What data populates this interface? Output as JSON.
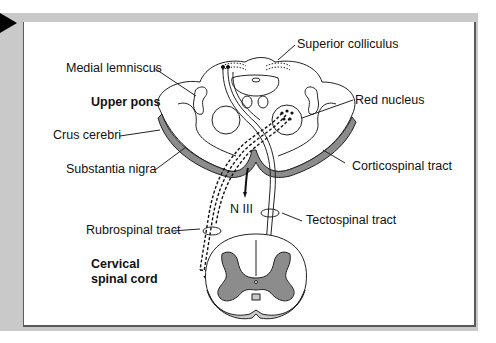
{
  "figure": {
    "marker_icon": "play-triangle-icon",
    "colors": {
      "frame": "#c9c9c9",
      "panel": "#ffffff",
      "border": "#5a5a5a",
      "gray_matter": "#8c8c8c",
      "ink": "#111111"
    },
    "section_labels": {
      "upper": "Upper pons",
      "lower_line1": "Cervical",
      "lower_line2": "spinal cord"
    },
    "labels": {
      "superior_colliculus": "Superior colliculus",
      "medial_lemniscus": "Medial lemniscus",
      "red_nucleus": "Red nucleus",
      "crus_cerebri": "Crus cerebri",
      "substantia_nigra": "Substantia nigra",
      "corticospinal_tract": "Corticospinal tract",
      "n_iii": "N III",
      "rubrospinal_tract": "Rubrospinal tract",
      "tectospinal_tract": "Tectospinal tract"
    }
  }
}
